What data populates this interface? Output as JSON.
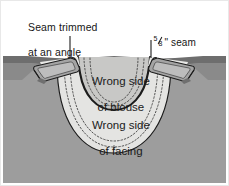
{
  "figure": {
    "width": 229,
    "height": 186,
    "background": "#ffffff"
  },
  "callouts": {
    "trim": {
      "line1": "Seam trimmed",
      "line2": "at an angle"
    },
    "seam_allowance": {
      "numerator": "5",
      "denominator": "8",
      "unit": "\"",
      "text": " seam",
      "full": "5/8\" seam"
    }
  },
  "regions": {
    "blouse": {
      "line1": "Wrong side",
      "line2": "of blouse"
    },
    "facing": {
      "line1": "Wrong side",
      "line2": "of facing"
    }
  },
  "colors": {
    "garment_body": "#9d9d9d",
    "garment_shoulder_dark": "#6e6e6e",
    "facing": "#e4e4e2",
    "blouse_inner": "#c8c8c6",
    "flap": "#a8a8a8",
    "outline": "#1c1c1c",
    "stitch": "#3a3a3a",
    "paper": "#ffffff"
  }
}
